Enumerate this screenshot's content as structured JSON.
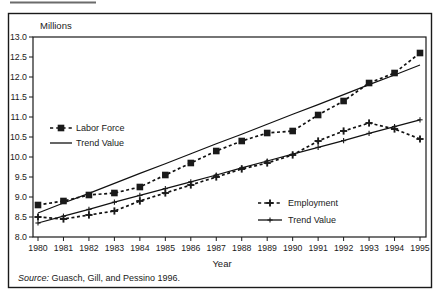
{
  "figure": {
    "unit_label": "Millions",
    "xlabel": "Year",
    "source_prefix": "Source:",
    "source_rest": " Guasch, Gill, and Pessino 1996."
  },
  "chart_data": {
    "type": "line",
    "title": "",
    "xlabel": "Year",
    "ylabel": "Millions",
    "grid": false,
    "ylim": [
      8.0,
      13.0
    ],
    "ytick_step": 0.5,
    "x": [
      1980,
      1981,
      1982,
      1983,
      1984,
      1985,
      1986,
      1987,
      1988,
      1989,
      1990,
      1991,
      1992,
      1993,
      1994,
      1995
    ],
    "series": [
      {
        "id": "labor-force",
        "name": "Labor Force",
        "style": "dashed",
        "marker": "square",
        "color": "#111111",
        "values": [
          8.8,
          8.9,
          9.05,
          9.1,
          9.25,
          9.55,
          9.85,
          10.15,
          10.4,
          10.6,
          10.65,
          11.05,
          11.4,
          11.85,
          12.1,
          12.6
        ]
      },
      {
        "id": "labor-force-trend",
        "name": "Trend Value",
        "style": "solid",
        "marker": "none",
        "color": "#111111",
        "values": [
          8.6,
          8.85,
          9.09,
          9.34,
          9.59,
          9.83,
          10.08,
          10.33,
          10.57,
          10.82,
          11.07,
          11.31,
          11.56,
          11.81,
          12.05,
          12.3
        ]
      },
      {
        "id": "employment",
        "name": "Employment",
        "style": "dashed",
        "marker": "plus-bold",
        "color": "#111111",
        "values": [
          8.5,
          8.45,
          8.55,
          8.65,
          8.9,
          9.1,
          9.3,
          9.5,
          9.7,
          9.85,
          10.05,
          10.4,
          10.65,
          10.85,
          10.7,
          10.45
        ]
      },
      {
        "id": "employment-trend",
        "name": "Trend Value",
        "style": "solid",
        "marker": "plus",
        "color": "#111111",
        "values": [
          8.35,
          8.52,
          8.69,
          8.87,
          9.04,
          9.21,
          9.38,
          9.55,
          9.73,
          9.9,
          10.07,
          10.24,
          10.41,
          10.59,
          10.76,
          10.93
        ]
      }
    ],
    "legends": [
      {
        "position": "upper-left",
        "series": [
          0,
          1
        ]
      },
      {
        "position": "lower-right",
        "series": [
          2,
          3
        ]
      }
    ]
  }
}
